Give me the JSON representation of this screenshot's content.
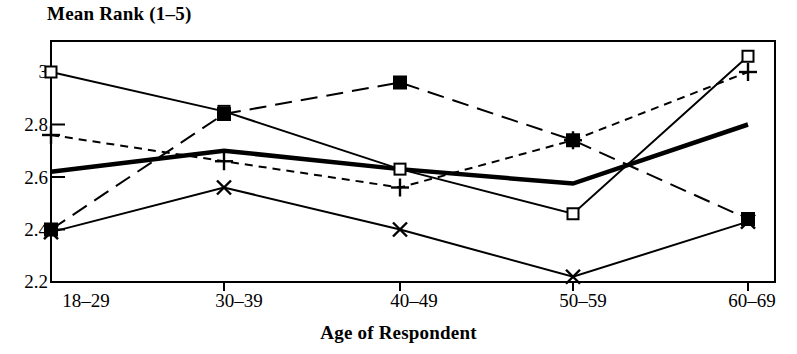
{
  "chart_data": {
    "type": "line",
    "title": "",
    "ylabel": "Mean Rank (1–5)",
    "xlabel": "Age of Respondent",
    "categories": [
      "18–29",
      "30–39",
      "40–49",
      "50–59",
      "60–69"
    ],
    "ylim": [
      2.2,
      3.06
    ],
    "yticks": [
      3,
      2.8,
      2.6,
      2.4,
      2.2
    ],
    "ytick_labels": [
      "3",
      "2.8",
      "2.6",
      "2.4",
      "2.2"
    ],
    "grid": false,
    "legend": "none",
    "series": [
      {
        "name": "open-square-series",
        "marker": "open-square",
        "line_style": "solid",
        "line_width": 2,
        "values": [
          3.0,
          2.85,
          2.63,
          2.46,
          3.06
        ]
      },
      {
        "name": "filled-square-series",
        "marker": "filled-square",
        "line_style": "long-dash",
        "line_width": 2,
        "values": [
          2.4,
          2.84,
          2.96,
          2.74,
          2.44
        ]
      },
      {
        "name": "plus-series",
        "marker": "plus",
        "line_style": "short-dash",
        "line_width": 2,
        "values": [
          2.76,
          2.66,
          2.56,
          2.74,
          3.0
        ]
      },
      {
        "name": "cross-series",
        "marker": "cross",
        "line_style": "solid",
        "line_width": 2,
        "values": [
          2.39,
          2.56,
          2.4,
          2.22,
          2.43
        ]
      },
      {
        "name": "thick-line-series",
        "marker": "none",
        "line_style": "solid",
        "line_width": 4.5,
        "values": [
          2.62,
          2.7,
          2.63,
          2.575,
          2.8
        ]
      }
    ]
  },
  "axes": {
    "y_title": "Mean Rank (1–5)",
    "x_title": "Age of Respondent",
    "y_tick_labels": [
      "3",
      "2.8",
      "2.6",
      "2.4",
      "2.2"
    ],
    "x_tick_labels": [
      "18–29",
      "30–39",
      "40–49",
      "50–59",
      "60–69"
    ]
  },
  "colors": {
    "ink": "#000000",
    "paper": "#ffffff"
  }
}
